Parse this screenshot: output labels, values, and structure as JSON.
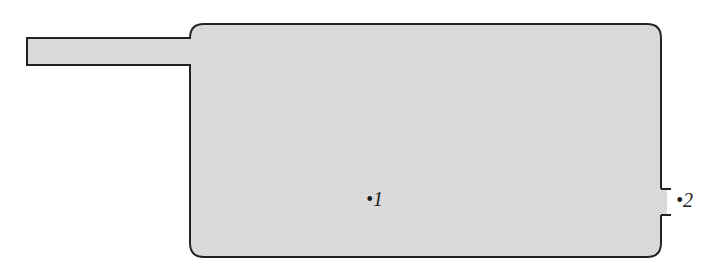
{
  "diagram": {
    "colors": {
      "fill": "#d9d9d9",
      "stroke": "#222222",
      "background": "#ffffff"
    },
    "labels": [
      {
        "id": "point-1",
        "text": "•1"
      },
      {
        "id": "point-2",
        "text": "•2"
      }
    ]
  }
}
